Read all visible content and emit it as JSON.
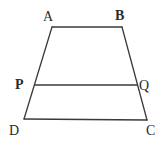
{
  "figure": {
    "kind": "trapezoid-with-transversal-segment",
    "background_color": "#ffffff",
    "stroke_color": "#3a3a3a",
    "stroke_width": 1.3,
    "label_color": "#2b2b2b",
    "labels": {
      "A": "A",
      "B": "B",
      "C": "C",
      "D": "D",
      "P": "P",
      "Q": "Q"
    },
    "points": {
      "A": {
        "x": 52,
        "y": 27
      },
      "B": {
        "x": 122,
        "y": 27
      },
      "C": {
        "x": 147,
        "y": 120
      },
      "D": {
        "x": 24,
        "y": 119
      },
      "P": {
        "x": 35,
        "y": 85
      },
      "Q": {
        "x": 137,
        "y": 85
      }
    },
    "segments": [
      {
        "name": "AB",
        "from": "A",
        "to": "B"
      },
      {
        "name": "BC",
        "from": "B",
        "to": "C"
      },
      {
        "name": "CD",
        "from": "C",
        "to": "D"
      },
      {
        "name": "DA",
        "from": "D",
        "to": "A"
      },
      {
        "name": "PQ",
        "from": "P",
        "to": "Q"
      }
    ]
  }
}
